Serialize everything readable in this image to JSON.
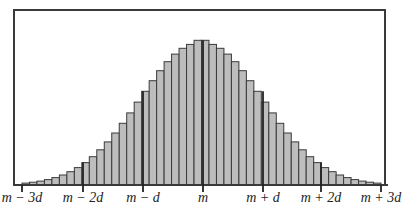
{
  "figure": {
    "type": "histogram-normal-distribution",
    "bar_fill": "#bdbdbd",
    "bar_stroke": "#3a3a3a",
    "frame_color": "#3a3a3a",
    "top_text_cropped": "...approximately..."
  },
  "chart_data": {
    "type": "bar",
    "title": "",
    "xlabel": "",
    "ylabel": "",
    "tick_labels": [
      "m − 3d",
      "m − 2d",
      "m − d",
      "m",
      "m + d",
      "m + 2d",
      "m + 3d"
    ],
    "tick_positions_sd": [
      -3,
      -2,
      -1,
      0,
      1,
      2,
      3
    ],
    "bins_per_sd": 8,
    "values": [
      1.9,
      2.8,
      3.9,
      5.4,
      7.4,
      10.0,
      13.3,
      17.4,
      22.4,
      28.3,
      35.2,
      43.1,
      52.0,
      61.7,
      72.1,
      82.9,
      93.7,
      104.3,
      114.3,
      123.3,
      130.9,
      136.7,
      140.6,
      144.7,
      144.7,
      140.6,
      136.7,
      130.9,
      123.3,
      114.3,
      104.3,
      93.7,
      82.9,
      72.1,
      61.7,
      52.0,
      43.1,
      35.2,
      28.3,
      22.4,
      17.4,
      13.3,
      10.0,
      7.4,
      5.4,
      3.9,
      2.8,
      1.9
    ],
    "grid": false,
    "legend": null
  },
  "axis": {
    "labels": [
      {
        "text": "m − 3d",
        "x": 22
      },
      {
        "text": "m − 2d",
        "x": 83
      },
      {
        "text": "m − d",
        "x": 143
      },
      {
        "text": "m",
        "x": 203
      },
      {
        "text": "m + d",
        "x": 263
      },
      {
        "text": "m + 2d",
        "x": 321
      },
      {
        "text": "m + 3d",
        "x": 381
      }
    ]
  }
}
